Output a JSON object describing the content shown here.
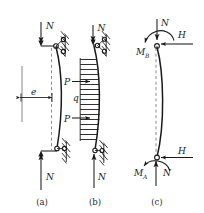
{
  "figure": {
    "panels": [
      {
        "id": "a",
        "caption": "(a)",
        "description": "Pin-ended column with eccentric axial load",
        "labels": {
          "top_force": "N",
          "bottom_force": "N",
          "eccentricity": "e"
        }
      },
      {
        "id": "b",
        "caption": "(b)",
        "description": "Pin-ended column with axial load plus lateral distributed and point loads",
        "labels": {
          "top_force": "N",
          "bottom_force": "N",
          "point_load_upper": "P",
          "point_load_lower": "P",
          "distributed_load": "q"
        }
      },
      {
        "id": "c",
        "caption": "(c)",
        "description": "Free body diagram of deflected column with end moments and horizontal reactions",
        "labels": {
          "top_force": "N",
          "bottom_force": "N",
          "top_horizontal": "H",
          "bottom_horizontal": "H",
          "top_moment": "M",
          "top_moment_sub": "B",
          "bottom_moment": "M",
          "bottom_moment_sub": "A"
        }
      }
    ],
    "colors": {
      "ink": "#1a1a1a",
      "gray": "#9a9a9a",
      "dashed": "#8c8c8c",
      "background": "#ffffff"
    }
  }
}
